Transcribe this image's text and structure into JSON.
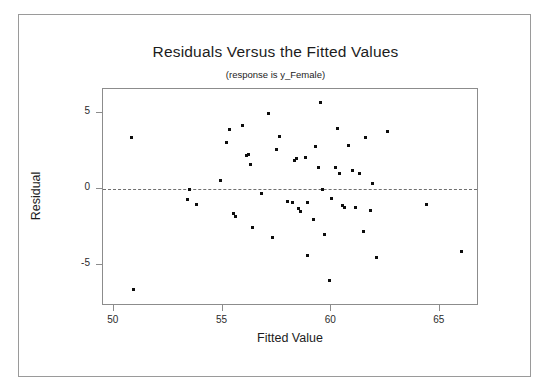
{
  "chart_data": {
    "type": "scatter",
    "title": "Residuals Versus the Fitted Values",
    "subtitle": "(response is y_Female)",
    "xlabel": "Fitted Value",
    "ylabel": "Residual",
    "xlim": [
      49.5,
      66.8
    ],
    "ylim": [
      -7.7,
      6.6
    ],
    "xticks": [
      50,
      55,
      60,
      65
    ],
    "yticks": [
      5,
      0,
      -5
    ],
    "grid": false,
    "legend": null,
    "reference_line": {
      "type": "horizontal",
      "y": 0,
      "style": "dashed"
    },
    "marker": {
      "shape": "square",
      "color": "#0d0d0d",
      "size": 3
    },
    "point_color": "#0d0d0d",
    "series": [
      {
        "name": "Residuals",
        "points": [
          [
            50.8,
            3.4
          ],
          [
            50.9,
            -6.6
          ],
          [
            53.5,
            0.0
          ],
          [
            53.4,
            -0.7
          ],
          [
            53.8,
            -1.0
          ],
          [
            54.9,
            0.6
          ],
          [
            55.2,
            3.1
          ],
          [
            55.3,
            3.9
          ],
          [
            55.5,
            -1.6
          ],
          [
            55.6,
            -1.8
          ],
          [
            55.9,
            4.2
          ],
          [
            56.1,
            2.2
          ],
          [
            56.2,
            2.3
          ],
          [
            56.3,
            1.6
          ],
          [
            56.4,
            -2.5
          ],
          [
            56.8,
            -0.3
          ],
          [
            57.1,
            5.0
          ],
          [
            57.3,
            -3.2
          ],
          [
            57.5,
            2.6
          ],
          [
            57.6,
            3.5
          ],
          [
            58.0,
            -0.8
          ],
          [
            58.2,
            -0.9
          ],
          [
            58.3,
            1.9
          ],
          [
            58.4,
            2.0
          ],
          [
            58.5,
            -1.3
          ],
          [
            58.6,
            -1.5
          ],
          [
            58.8,
            2.1
          ],
          [
            58.9,
            -0.9
          ],
          [
            58.9,
            -4.4
          ],
          [
            59.2,
            -2.0
          ],
          [
            59.3,
            2.8
          ],
          [
            59.4,
            1.4
          ],
          [
            59.5,
            5.7
          ],
          [
            59.6,
            0.0
          ],
          [
            59.7,
            -3.0
          ],
          [
            59.9,
            -6.0
          ],
          [
            60.0,
            -0.6
          ],
          [
            60.2,
            1.4
          ],
          [
            60.3,
            4.0
          ],
          [
            60.4,
            1.0
          ],
          [
            60.5,
            -1.1
          ],
          [
            60.6,
            -1.2
          ],
          [
            60.8,
            2.9
          ],
          [
            61.0,
            1.2
          ],
          [
            61.1,
            -1.2
          ],
          [
            61.3,
            1.0
          ],
          [
            61.5,
            -2.8
          ],
          [
            61.6,
            3.4
          ],
          [
            61.8,
            -1.4
          ],
          [
            61.9,
            0.4
          ],
          [
            62.1,
            -4.5
          ],
          [
            62.6,
            3.8
          ],
          [
            64.4,
            -1.0
          ],
          [
            66.0,
            -4.1
          ]
        ]
      }
    ]
  }
}
